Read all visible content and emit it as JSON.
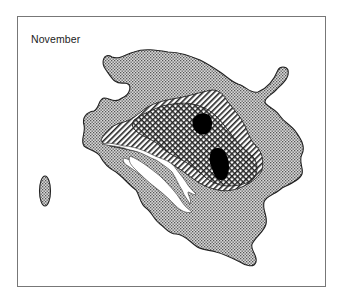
{
  "map": {
    "title": "November",
    "regions": [
      {
        "name": "outer-extent",
        "pattern": "fine-dot-stipple",
        "color": "#b8b8b8"
      },
      {
        "name": "intermediate-zone",
        "pattern": "diagonal-hatch",
        "color": "#ffffff"
      },
      {
        "name": "inner-zone",
        "pattern": "crosshatch",
        "color": "#ffffff"
      },
      {
        "name": "core-areas",
        "pattern": "solid",
        "color": "#000000",
        "count": 2
      },
      {
        "name": "landmass",
        "pattern": "blank",
        "color": "#ffffff"
      },
      {
        "name": "isolated-patch",
        "pattern": "fine-dot-stipple",
        "color": "#b8b8b8"
      }
    ]
  }
}
